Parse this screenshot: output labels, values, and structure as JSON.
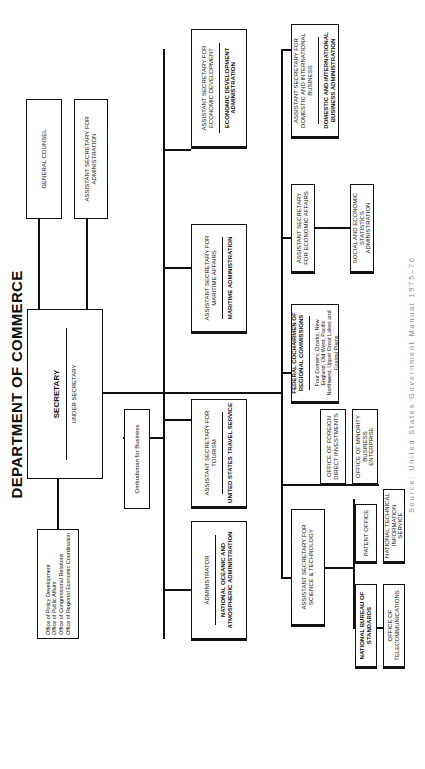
{
  "title": "DEPARTMENT OF COMMERCE",
  "caption": "Source: United States Government Manual 1975–76",
  "secretary": {
    "title": "SECRETARY",
    "subtitle": "UNDER SECRETARY"
  },
  "staff_offices": {
    "items": [
      "Office of Policy Development",
      "Office of Public Affairs",
      "Office of Congressional Relations",
      "Office of Regional Economic Coordination"
    ]
  },
  "general_counsel": "GENERAL COUNSEL",
  "asst_admin": "ASSISTANT SECRETARY FOR ADMINISTRATION",
  "ombudsman": "Ombudsman for Business",
  "units": {
    "noaa": {
      "head": "ADMINISTRATOR",
      "agency": "NATIONAL OCEANIC AND ATMOSPHERIC ADMINISTRATION"
    },
    "tourism": {
      "head": "ASSISTANT SECRETARY FOR TOURISM",
      "agency": "UNITED STATES TRAVEL SERVICE"
    },
    "maritime": {
      "head": "ASSISTANT SECRETARY FOR MARITIME AFFAIRS",
      "agency": "MARITIME ADMINISTRATION"
    },
    "econ_dev": {
      "head": "ASSISTANT SECRETARY FOR ECONOMIC DEVELOPMENT",
      "agency": "ECONOMIC DEVELOPMENT ADMINISTRATION"
    },
    "science": {
      "head": "ASSISTANT SECRETARY FOR SCIENCE & TECHNOLOGY"
    },
    "regional": {
      "head": "FEDERAL COCHAIRMEN OF REGIONAL COMMISSIONS",
      "detail": "Four Corners, Ozarks, New England, Old West, Pacific Northwest, Upper Great Lakes and Coastal Plains"
    },
    "econ_affairs": {
      "head": "ASSISTANT SECRETARY FOR ECONOMIC AFFAIRS"
    },
    "domestic_intl": {
      "head": "ASSISTANT SECRETARY FOR DOMESTIC AND INTERNATIONAL BUSINESS",
      "agency": "DOMESTIC AND INTERNATIONAL BUSINESS ADMINISTRATION"
    }
  },
  "science_subunits": {
    "nbs": "NATIONAL BUREAU OF STANDARDS",
    "patent": "PATENT OFFICE",
    "telecom": "OFFICE OF TELECOMMUNICATIONS",
    "ntis": "NATIONAL TECHNICAL INFORMATION SERVICE"
  },
  "other_offices": {
    "fdi": "OFFICE OF FOREIGN DIRECT INVESTMENTS",
    "mbe": "OFFICE OF MINORITY BUSINESS ENTERPRISE"
  },
  "econ_affairs_sub": "SOCIAL AND ECONOMIC STATISTICS ADMINISTRATION"
}
